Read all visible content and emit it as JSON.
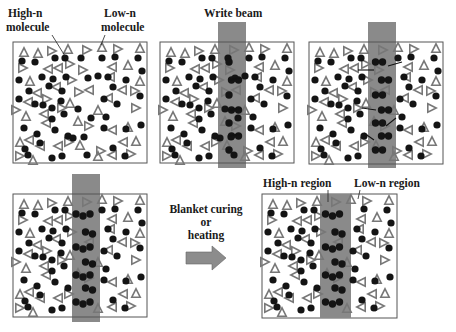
{
  "figure": {
    "labels": {
      "high_n_molecule": [
        "High-n",
        "molecule"
      ],
      "low_n_molecule": [
        "Low-n",
        "molecule"
      ],
      "write_beam": "Write beam",
      "process": [
        "Blanket curing",
        "or",
        "heating"
      ],
      "high_n_region": "High-n region",
      "low_n_region": "Low-n region"
    },
    "colors": {
      "beam": "#8a8a8a",
      "high_n_molecule": "#141414",
      "low_n_molecule": "#777777",
      "frame": "#555555",
      "arrow": "#8c8c8c"
    },
    "legend": {
      "high_n_molecule_shape": "filled-circle",
      "low_n_molecule_shape": "open-triangle"
    },
    "panels": [
      {
        "id": "initial",
        "stage": "Uniform mixture before exposure",
        "box": [
          13,
          42,
          134,
          121
        ],
        "beam": null
      },
      {
        "id": "exposure-start",
        "stage": "Write beam exposure, early",
        "box": [
          160,
          42,
          134,
          121
        ],
        "beam": [
          218,
          22,
          28,
          146
        ]
      },
      {
        "id": "exposure-mid",
        "stage": "Write beam exposure, diffusion",
        "box": [
          309,
          42,
          134,
          122
        ],
        "beam": [
          368,
          22,
          28,
          146
        ]
      },
      {
        "id": "exposure-end",
        "stage": "Write beam exposure, high-n enriched",
        "box": [
          13,
          194,
          134,
          123
        ],
        "beam": [
          72,
          174,
          28,
          148
        ]
      },
      {
        "id": "fixed",
        "stage": "After blanket curing or heating",
        "box": [
          262,
          194,
          135,
          124
        ],
        "beam": [
          320,
          194,
          31,
          124
        ]
      }
    ],
    "base_dots": [
      [
        22,
        61
      ],
      [
        35,
        62
      ],
      [
        55,
        58
      ],
      [
        65,
        58
      ],
      [
        81,
        58
      ],
      [
        102,
        58
      ],
      [
        115,
        57
      ],
      [
        138,
        58
      ],
      [
        19,
        80
      ],
      [
        42,
        77
      ],
      [
        53,
        79
      ],
      [
        66,
        77
      ],
      [
        88,
        78
      ],
      [
        98,
        76
      ],
      [
        108,
        77
      ],
      [
        126,
        80
      ],
      [
        142,
        71
      ],
      [
        29,
        91
      ],
      [
        49,
        86
      ],
      [
        62,
        91
      ],
      [
        113,
        87
      ],
      [
        140,
        96
      ],
      [
        19,
        99
      ],
      [
        35,
        104
      ],
      [
        43,
        105
      ],
      [
        52,
        108
      ],
      [
        61,
        101
      ],
      [
        78,
        109
      ],
      [
        104,
        99
      ],
      [
        117,
        104
      ],
      [
        24,
        128
      ],
      [
        52,
        119
      ],
      [
        64,
        114
      ],
      [
        91,
        118
      ],
      [
        106,
        117
      ],
      [
        141,
        125
      ],
      [
        37,
        134
      ],
      [
        55,
        130
      ],
      [
        68,
        136
      ],
      [
        84,
        137
      ],
      [
        104,
        128
      ],
      [
        126,
        129
      ],
      [
        25,
        149
      ],
      [
        40,
        143
      ],
      [
        73,
        138
      ],
      [
        113,
        148
      ],
      [
        28,
        155
      ],
      [
        52,
        158
      ],
      [
        62,
        156
      ],
      [
        87,
        155
      ],
      [
        125,
        156
      ]
    ],
    "base_tris": [
      [
        24,
        52,
        1
      ],
      [
        38,
        53,
        1
      ],
      [
        52,
        51,
        0
      ],
      [
        68,
        49,
        1
      ],
      [
        87,
        50,
        0
      ],
      [
        102,
        47,
        1
      ],
      [
        118,
        49,
        0
      ],
      [
        140,
        48,
        1
      ],
      [
        23,
        68,
        0
      ],
      [
        48,
        69,
        2
      ],
      [
        58,
        68,
        2
      ],
      [
        70,
        64,
        0
      ],
      [
        83,
        70,
        0
      ],
      [
        112,
        67,
        2
      ],
      [
        128,
        65,
        1
      ],
      [
        30,
        81,
        1
      ],
      [
        72,
        80,
        0
      ],
      [
        110,
        77,
        2
      ],
      [
        140,
        81,
        1
      ],
      [
        37,
        93,
        2
      ],
      [
        56,
        87,
        2
      ],
      [
        79,
        92,
        0
      ],
      [
        89,
        90,
        2
      ],
      [
        122,
        90,
        2
      ],
      [
        135,
        91,
        0
      ],
      [
        28,
        102,
        2
      ],
      [
        47,
        99,
        0
      ],
      [
        70,
        103,
        1
      ],
      [
        108,
        98,
        2
      ],
      [
        16,
        110,
        0
      ],
      [
        26,
        116,
        1
      ],
      [
        44,
        114,
        2
      ],
      [
        62,
        108,
        0
      ],
      [
        98,
        110,
        1
      ],
      [
        136,
        108,
        0
      ],
      [
        46,
        123,
        2
      ],
      [
        78,
        121,
        1
      ],
      [
        89,
        126,
        0
      ],
      [
        112,
        130,
        2
      ],
      [
        128,
        127,
        1
      ],
      [
        20,
        142,
        1
      ],
      [
        29,
        140,
        2
      ],
      [
        40,
        146,
        2
      ],
      [
        58,
        146,
        2
      ],
      [
        69,
        142,
        0
      ],
      [
        80,
        145,
        1
      ],
      [
        101,
        151,
        0
      ],
      [
        123,
        142,
        2
      ],
      [
        136,
        141,
        1
      ],
      [
        20,
        156,
        0
      ],
      [
        33,
        160,
        1
      ],
      [
        98,
        156,
        1
      ],
      [
        112,
        155,
        2
      ],
      [
        131,
        154,
        0
      ]
    ]
  }
}
